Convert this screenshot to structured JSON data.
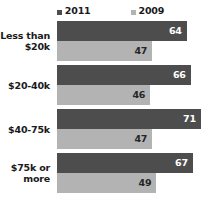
{
  "chart_data": {
    "type": "bar",
    "orientation": "horizontal",
    "title": "",
    "subtitle": "",
    "xlabel": "",
    "ylabel": "",
    "categories": [
      "Less than $20k",
      "$20-40k",
      "$40-75k",
      "$75k or more"
    ],
    "category_lines": [
      [
        "Less than",
        "$20k"
      ],
      [
        "$20-40k"
      ],
      [
        "$40-75k"
      ],
      [
        "$75k or",
        "more"
      ]
    ],
    "series": [
      {
        "name": "2011",
        "color": "#4d4d4d",
        "values": [
          64,
          66,
          71,
          67
        ]
      },
      {
        "name": "2009",
        "color": "#b3b3b3",
        "values": [
          47,
          46,
          47,
          49
        ]
      }
    ],
    "legend": {
      "position": "top-center",
      "entries": [
        {
          "label": "2011",
          "color": "#4d4d4d",
          "marker": "square"
        },
        {
          "label": "2009",
          "color": "#b3b3b3",
          "marker": "square"
        }
      ]
    },
    "xlim": [
      0,
      74
    ],
    "grid": false,
    "data_labels": true,
    "background": "#ffffff"
  }
}
